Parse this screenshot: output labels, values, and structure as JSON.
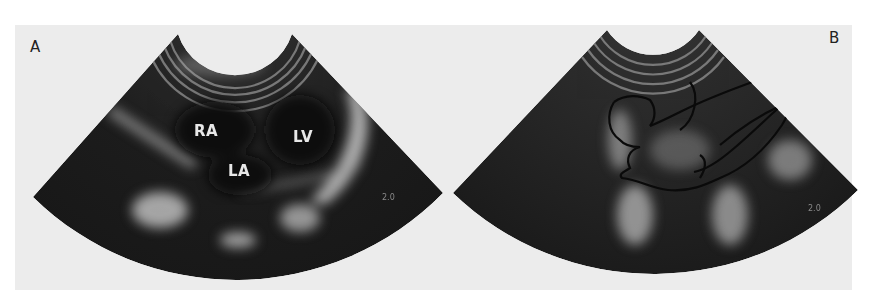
{
  "figure": {
    "panels": [
      {
        "id": "A",
        "letter": "A",
        "modality": "echocardiogram",
        "labels": [
          {
            "text": "RA",
            "meaning": "right atrium"
          },
          {
            "text": "LA",
            "meaning": "left atrium"
          },
          {
            "text": "LV",
            "meaning": "left ventricle"
          }
        ],
        "scale_mark": "2.0"
      },
      {
        "id": "B",
        "letter": "B",
        "modality": "echocardiogram",
        "annotation": "hand-drawn outline tracing cardiac chambers",
        "scale_mark": "2.0"
      }
    ],
    "colors": {
      "background": "#ececec",
      "fan_dark": "#1e1e1e",
      "label_text": "#e8e8e8"
    }
  }
}
